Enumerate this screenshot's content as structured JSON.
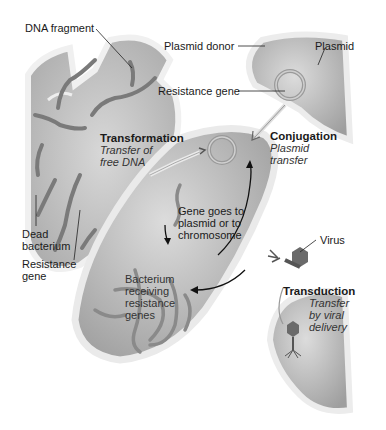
{
  "labels": {
    "dna_fragment": "DNA fragment",
    "plasmid_donor": "Plasmid donor",
    "plasmid": "Plasmid",
    "resistance_gene_top": "Resistance gene",
    "transformation": {
      "title": "Transformation",
      "line1": "Transfer of",
      "line2": "free DNA"
    },
    "conjugation": {
      "title": "Conjugation",
      "line1": "Plasmid",
      "line2": "transfer"
    },
    "gene_goes": {
      "line1": "Gene goes to",
      "line2": "plasmid or to",
      "line3": "chromosome"
    },
    "dead_bacterium": {
      "line1": "Dead",
      "line2": "bacterium"
    },
    "resistance_gene_left": {
      "line1": "Resistance",
      "line2": "gene"
    },
    "virus": "Virus",
    "bacterium_receiving": {
      "line1": "Bacterium",
      "line2": "receiving",
      "line3": "resistance",
      "line4": "genes"
    },
    "transduction": {
      "title": "Transduction",
      "line1": "Transfer",
      "line2": "by viral",
      "line3": "delivery"
    }
  },
  "colors": {
    "cell_fill": "#bdbdbd",
    "cell_wall": "#e8e8e8",
    "dna": "#7a7a7a",
    "text": "#1a1a1a"
  }
}
